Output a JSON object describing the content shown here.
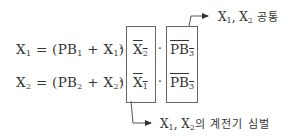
{
  "equations": [
    {
      "lhs": "X",
      "lhs_sub": "1",
      "eq": " = (PB",
      "pb_sub": "1",
      "plus": " + X",
      "x_sub": "1",
      "close": ")"
    },
    {
      "lhs": "X",
      "lhs_sub": "2",
      "eq": " = (PB",
      "pb_sub": "2",
      "plus": " + X",
      "x_sub": "2",
      "close": ")"
    }
  ],
  "dot": "·",
  "interlock_box": {
    "rows": [
      {
        "text": "X",
        "sub": "2"
      },
      {
        "text": "X",
        "sub": "1"
      }
    ]
  },
  "common_box": {
    "rows": [
      {
        "text": "PB",
        "sub": "3"
      },
      {
        "text": "PB",
        "sub": "3"
      }
    ]
  },
  "labels": {
    "common": {
      "x1": "X",
      "s1": "1",
      "sep": ", X",
      "s2": "2",
      "kr": " 공통"
    },
    "relay": {
      "x1": "X",
      "s1": "1",
      "sep": ", X",
      "s2": "2",
      "kr": "의 계전기 심벌"
    }
  },
  "colors": {
    "line": "#555555",
    "text": "#333333"
  }
}
